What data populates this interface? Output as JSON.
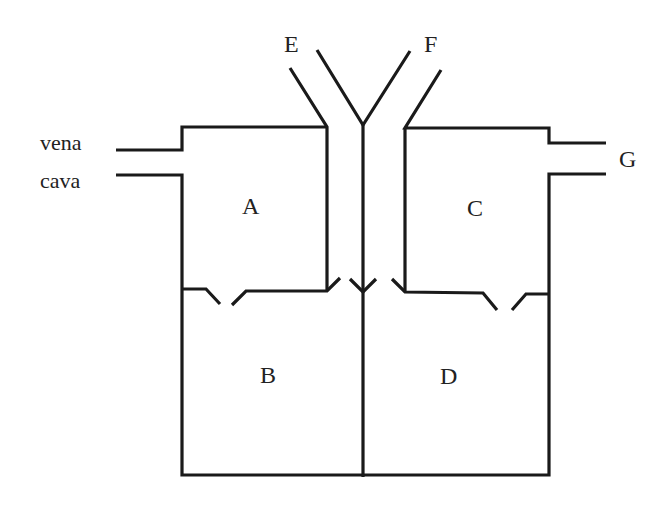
{
  "diagram": {
    "type": "heart-schematic",
    "labels": {
      "vena": "vena",
      "cava": "cava",
      "A": "A",
      "B": "B",
      "C": "C",
      "D": "D",
      "E": "E",
      "F": "F",
      "G": "G"
    },
    "chambers": [
      {
        "id": "A",
        "position": "upper-left"
      },
      {
        "id": "B",
        "position": "lower-left"
      },
      {
        "id": "C",
        "position": "upper-right"
      },
      {
        "id": "D",
        "position": "lower-right"
      }
    ],
    "vessels": [
      {
        "id": "vena-cava",
        "connects_to": "A"
      },
      {
        "id": "E",
        "connects_to": "A"
      },
      {
        "id": "F",
        "connects_to": "C"
      },
      {
        "id": "G",
        "connects_to": "C"
      }
    ],
    "line_color": "#1a1a1a",
    "background": "#ffffff"
  }
}
